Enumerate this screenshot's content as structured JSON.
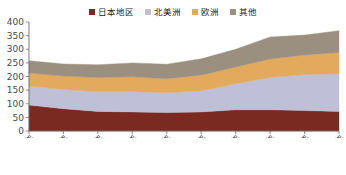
{
  "legend": {
    "position": "top-center",
    "items": [
      {
        "label": "日本地区",
        "color": "#7B2A22",
        "icon": "square-marker-icon"
      },
      {
        "label": "北美洲",
        "color": "#BFC0D8",
        "icon": "square-marker-icon"
      },
      {
        "label": "欧洲",
        "color": "#E3A95C",
        "icon": "square-marker-icon"
      },
      {
        "label": "其他",
        "color": "#9B9080",
        "icon": "square-marker-icon"
      }
    ]
  },
  "chart_data": {
    "type": "area",
    "stacked": true,
    "title": "",
    "subtitle": "",
    "xlabel": "",
    "ylabel": "",
    "grid": false,
    "legend_position": "top-center",
    "categories": [
      "1997年",
      "1998年",
      "1999年",
      "2000年",
      "2001年",
      "2002年",
      "2003年",
      "2004年",
      "2005年",
      "2006年"
    ],
    "x_tick_labels": [
      "1997年",
      "1998年",
      "1999年",
      "2000年",
      "2001年",
      "2002年",
      "2003年",
      "2004年",
      "2005年",
      "2006年"
    ],
    "y_tick_labels": [
      "0",
      "50",
      "100",
      "150",
      "200",
      "250",
      "300",
      "350",
      "400"
    ],
    "y_ticks": [
      0,
      50,
      100,
      150,
      200,
      250,
      300,
      350,
      400
    ],
    "ylim": [
      0,
      400
    ],
    "series": [
      {
        "name": "日本地区",
        "color": "#7B2A22",
        "values": [
          95,
          82,
          72,
          70,
          68,
          70,
          78,
          78,
          75,
          72
        ]
      },
      {
        "name": "北美洲",
        "color": "#BFC0D8",
        "values": [
          70,
          70,
          72,
          74,
          72,
          78,
          95,
          118,
          132,
          138
        ]
      },
      {
        "name": "欧洲",
        "color": "#E3A95C",
        "values": [
          48,
          50,
          52,
          55,
          52,
          57,
          62,
          68,
          72,
          78
        ]
      },
      {
        "name": "其他",
        "color": "#9B9080",
        "values": [
          45,
          44,
          47,
          51,
          53,
          60,
          65,
          81,
          73,
          80
        ]
      }
    ],
    "totals": [
      258,
      246,
      243,
      250,
      245,
      265,
      300,
      345,
      352,
      368
    ]
  }
}
